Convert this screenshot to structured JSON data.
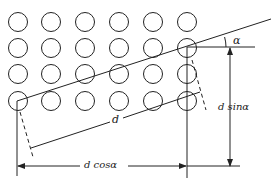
{
  "diagram": {
    "type": "tube-bank geometry",
    "grid": {
      "columns": 6,
      "rows": 4,
      "col_x": [
        18,
        51,
        85,
        119,
        153,
        187
      ],
      "row_y": [
        22,
        48,
        74,
        101
      ],
      "radius": 9.5
    },
    "labels": {
      "alpha": "α",
      "d": "d",
      "d_sin": "d sinα",
      "d_cos": "d cosα"
    },
    "colors": {
      "stroke": "#222222",
      "background": "#ffffff"
    }
  }
}
